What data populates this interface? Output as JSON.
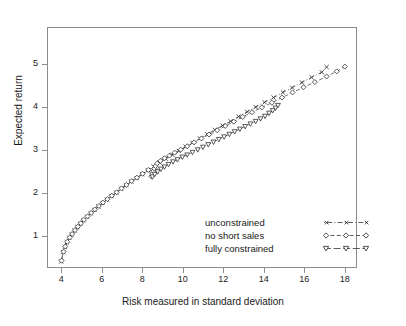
{
  "chart_data": {
    "type": "scatter",
    "title": "",
    "xlabel": "Risk measured in standard deviation",
    "ylabel": "Expected return",
    "xlim": [
      3.3,
      18.6
    ],
    "ylim": [
      0.25,
      5.85
    ],
    "xticks": [
      4,
      6,
      8,
      10,
      12,
      14,
      16,
      18
    ],
    "yticks": [
      1,
      2,
      3,
      4,
      5
    ],
    "grid": false,
    "legend_position": "lower right",
    "series": [
      {
        "name": "unconstrained",
        "marker": "x",
        "line": "dotdash",
        "color": "#333333",
        "points": [
          [
            4.0,
            0.4
          ],
          [
            4.1,
            0.62
          ],
          [
            4.18,
            0.74
          ],
          [
            4.28,
            0.85
          ],
          [
            4.4,
            0.95
          ],
          [
            4.52,
            1.03
          ],
          [
            4.66,
            1.12
          ],
          [
            4.8,
            1.2
          ],
          [
            4.95,
            1.28
          ],
          [
            5.1,
            1.36
          ],
          [
            5.28,
            1.44
          ],
          [
            5.46,
            1.52
          ],
          [
            5.64,
            1.6
          ],
          [
            5.84,
            1.68
          ],
          [
            6.04,
            1.76
          ],
          [
            6.26,
            1.84
          ],
          [
            6.48,
            1.92
          ],
          [
            6.72,
            2.0
          ],
          [
            6.96,
            2.09
          ],
          [
            7.2,
            2.17
          ],
          [
            7.46,
            2.26
          ],
          [
            7.72,
            2.34
          ],
          [
            8.0,
            2.43
          ],
          [
            8.28,
            2.52
          ],
          [
            8.56,
            2.61
          ],
          [
            8.86,
            2.7
          ],
          [
            9.16,
            2.79
          ],
          [
            9.48,
            2.88
          ],
          [
            9.8,
            2.97
          ],
          [
            10.14,
            3.07
          ],
          [
            10.48,
            3.16
          ],
          [
            10.84,
            3.26
          ],
          [
            11.2,
            3.36
          ],
          [
            11.58,
            3.46
          ],
          [
            11.96,
            3.56
          ],
          [
            12.36,
            3.66
          ],
          [
            12.76,
            3.77
          ],
          [
            13.18,
            3.88
          ],
          [
            13.6,
            3.99
          ],
          [
            14.04,
            4.1
          ],
          [
            14.48,
            4.21
          ],
          [
            14.94,
            4.33
          ],
          [
            15.4,
            4.44
          ],
          [
            15.88,
            4.56
          ],
          [
            16.36,
            4.68
          ],
          [
            16.86,
            4.8
          ],
          [
            17.1,
            4.92
          ]
        ]
      },
      {
        "name": "no short sales",
        "marker": "diamond",
        "line": "dashed",
        "color": "#333333",
        "points": [
          [
            4.02,
            0.42
          ],
          [
            4.12,
            0.63
          ],
          [
            4.2,
            0.75
          ],
          [
            4.3,
            0.86
          ],
          [
            4.42,
            0.96
          ],
          [
            4.54,
            1.04
          ],
          [
            4.68,
            1.13
          ],
          [
            4.82,
            1.21
          ],
          [
            4.97,
            1.29
          ],
          [
            5.12,
            1.37
          ],
          [
            5.3,
            1.45
          ],
          [
            5.48,
            1.53
          ],
          [
            5.66,
            1.61
          ],
          [
            5.86,
            1.69
          ],
          [
            6.06,
            1.77
          ],
          [
            6.28,
            1.85
          ],
          [
            6.5,
            1.93
          ],
          [
            6.74,
            2.01
          ],
          [
            6.98,
            2.1
          ],
          [
            7.22,
            2.18
          ],
          [
            7.48,
            2.27
          ],
          [
            7.74,
            2.35
          ],
          [
            8.02,
            2.44
          ],
          [
            8.3,
            2.53
          ],
          [
            8.45,
            2.38
          ],
          [
            8.5,
            2.44
          ],
          [
            8.55,
            2.5
          ],
          [
            8.6,
            2.56
          ],
          [
            8.66,
            2.62
          ],
          [
            8.74,
            2.68
          ],
          [
            8.9,
            2.74
          ],
          [
            9.1,
            2.8
          ],
          [
            9.34,
            2.86
          ],
          [
            9.6,
            2.93
          ],
          [
            9.9,
            3.0
          ],
          [
            10.22,
            3.08
          ],
          [
            10.56,
            3.17
          ],
          [
            10.92,
            3.26
          ],
          [
            11.3,
            3.35
          ],
          [
            11.7,
            3.45
          ],
          [
            12.1,
            3.55
          ],
          [
            12.52,
            3.65
          ],
          [
            12.96,
            3.76
          ],
          [
            13.42,
            3.87
          ],
          [
            13.9,
            3.98
          ],
          [
            14.4,
            4.09
          ],
          [
            14.9,
            4.21
          ],
          [
            15.42,
            4.33
          ],
          [
            15.96,
            4.45
          ],
          [
            16.52,
            4.57
          ],
          [
            17.1,
            4.7
          ],
          [
            17.6,
            4.82
          ],
          [
            18.0,
            4.93
          ]
        ]
      },
      {
        "name": "fully constrained",
        "marker": "triangle-down",
        "line": "dashed",
        "color": "#333333",
        "points": [
          [
            8.5,
            2.37
          ],
          [
            8.62,
            2.43
          ],
          [
            8.76,
            2.49
          ],
          [
            8.92,
            2.55
          ],
          [
            9.1,
            2.6
          ],
          [
            9.3,
            2.66
          ],
          [
            9.52,
            2.72
          ],
          [
            9.74,
            2.77
          ],
          [
            9.98,
            2.83
          ],
          [
            10.22,
            2.88
          ],
          [
            10.48,
            2.94
          ],
          [
            10.74,
            3.0
          ],
          [
            11.0,
            3.06
          ],
          [
            11.26,
            3.12
          ],
          [
            11.52,
            3.18
          ],
          [
            11.78,
            3.24
          ],
          [
            12.04,
            3.3
          ],
          [
            12.3,
            3.36
          ],
          [
            12.56,
            3.42
          ],
          [
            12.82,
            3.48
          ],
          [
            13.08,
            3.54
          ],
          [
            13.34,
            3.6
          ],
          [
            13.6,
            3.66
          ],
          [
            13.84,
            3.72
          ],
          [
            14.06,
            3.78
          ],
          [
            14.26,
            3.85
          ],
          [
            14.44,
            3.91
          ],
          [
            14.58,
            3.97
          ],
          [
            14.7,
            4.03
          ]
        ]
      }
    ]
  },
  "axis": {
    "x_tick_labels": [
      "4",
      "6",
      "8",
      "10",
      "12",
      "14",
      "16",
      "18"
    ],
    "y_tick_labels": [
      "1",
      "2",
      "3",
      "4",
      "5"
    ],
    "x_title": "Risk measured in standard deviation",
    "y_title": "Expected return"
  },
  "legend": {
    "entries": [
      {
        "label": "unconstrained",
        "key": "x-dotdash-key"
      },
      {
        "label": "no short sales",
        "key": "diamond-dashed-key"
      },
      {
        "label": "fully constrained",
        "key": "triangle-dashed-key"
      }
    ]
  }
}
